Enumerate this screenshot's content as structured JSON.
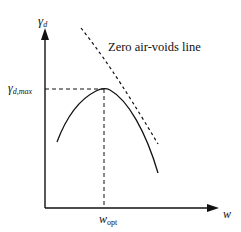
{
  "diagram": {
    "y_axis": {
      "label": "γ",
      "label_sub": "d"
    },
    "x_axis": {
      "label": "w"
    },
    "peak_label": {
      "main": "γ",
      "sub": "d,max"
    },
    "opt_label": {
      "main": "w",
      "sub": "opt"
    },
    "zav_label": "Zero air-voids line",
    "colors": {
      "line": "#111111",
      "background": "#ffffff"
    }
  }
}
